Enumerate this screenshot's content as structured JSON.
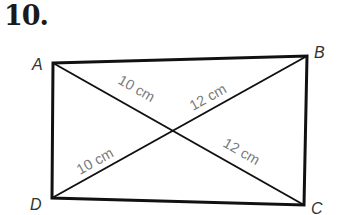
{
  "problem": {
    "number": "10."
  },
  "figure": {
    "shape": "rectangle with diagonals",
    "vertices": {
      "A": {
        "label": "A",
        "x": 53,
        "y": 63
      },
      "B": {
        "label": "B",
        "x": 307,
        "y": 56
      },
      "C": {
        "label": "C",
        "x": 304,
        "y": 205
      },
      "D": {
        "label": "D",
        "x": 52,
        "y": 198
      }
    },
    "intersection": {
      "x": 174,
      "y": 130
    },
    "segment_labels": {
      "AO": "10 cm",
      "BO": "12 cm",
      "DO": "10 cm",
      "CO": "12 cm"
    },
    "colors": {
      "lines": "#111111",
      "vertex_labels": "#333333",
      "measure_labels": "#7a7a7a"
    }
  }
}
